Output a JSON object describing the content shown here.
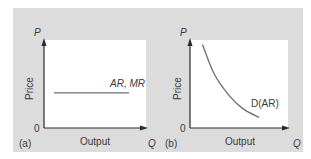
{
  "chart_data": [
    {
      "type": "line",
      "panel_label": "(a)",
      "xlabel": "Output",
      "ylabel": "Price",
      "x_axis_letter": "Q",
      "y_axis_letter": "P",
      "origin_label": "0",
      "grid": false,
      "series": [
        {
          "name": "AR, MR",
          "shape": "horizontal",
          "x": [
            0.1,
            0.85
          ],
          "y": [
            0.4,
            0.4
          ]
        }
      ],
      "xlim": [
        0,
        1
      ],
      "ylim": [
        0,
        1
      ]
    },
    {
      "type": "line",
      "panel_label": "(b)",
      "xlabel": "Output",
      "ylabel": "Price",
      "x_axis_letter": "Q",
      "y_axis_letter": "P",
      "origin_label": "0",
      "grid": false,
      "series": [
        {
          "name": "D(AR)",
          "shape": "downward-convex",
          "x": [
            0.13,
            0.25,
            0.4,
            0.55,
            0.72
          ],
          "y": [
            0.95,
            0.62,
            0.38,
            0.22,
            0.12
          ]
        }
      ],
      "xlim": [
        0,
        1
      ],
      "ylim": [
        0,
        1
      ]
    }
  ],
  "colors": {
    "panel_background": "#dcdcdc",
    "plot_background": "#ffffff",
    "axis": "#2b2b2b",
    "curve": "#6e6e6e",
    "text": "#3a3a3a"
  }
}
